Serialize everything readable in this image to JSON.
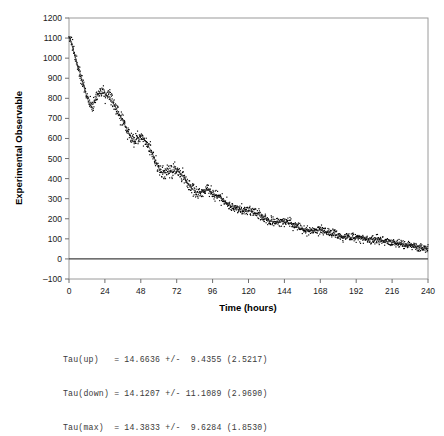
{
  "chart_data": {
    "type": "scatter",
    "title": "",
    "xlabel": "Time (hours)",
    "ylabel": "Experimental Observable",
    "xlim": [
      0,
      240
    ],
    "ylim": [
      -100,
      1200
    ],
    "xticks": [
      0,
      24,
      48,
      72,
      96,
      120,
      144,
      168,
      192,
      216,
      240
    ],
    "yticks": [
      -100,
      0,
      100,
      200,
      300,
      400,
      500,
      600,
      700,
      800,
      900,
      1000,
      1100,
      1200
    ],
    "xtick_labels": [
      "0",
      "24",
      "48",
      "72",
      "96",
      "120",
      "144",
      "168",
      "192",
      "216",
      "240"
    ],
    "ytick_labels": [
      "-100",
      "0",
      "100",
      "200",
      "300",
      "400",
      "500",
      "600",
      "700",
      "800",
      "900",
      "1000",
      "1100",
      "1200"
    ],
    "grid": false,
    "legend": null,
    "zero_line": 0,
    "marker_color": "#000000",
    "fit_line_color": "#333333",
    "series": [
      {
        "name": "Experimental data",
        "type": "scatter",
        "marker": "small-dot",
        "noise_amplitude": 28,
        "n_points": 1400
      },
      {
        "name": "Fitted decay curve",
        "type": "line",
        "model": "damped-oscillatory-exponential"
      }
    ],
    "envelope_x": [
      0,
      4,
      8,
      12,
      14,
      16,
      18,
      20,
      22,
      24,
      28,
      32,
      36,
      40,
      42,
      44,
      46,
      48,
      52,
      56,
      60,
      62,
      64,
      66,
      68,
      70,
      72,
      76,
      80,
      84,
      88,
      90,
      92,
      94,
      96,
      100,
      104,
      108,
      112,
      116,
      120,
      124,
      128,
      132,
      136,
      140,
      144,
      148,
      152,
      156,
      160,
      164,
      168,
      172,
      176,
      180,
      184,
      188,
      192,
      196,
      200,
      204,
      208,
      212,
      216,
      220,
      224,
      228,
      232,
      236,
      240
    ],
    "envelope_y": [
      1105,
      1010,
      910,
      810,
      775,
      772,
      800,
      828,
      832,
      820,
      792,
      742,
      688,
      628,
      600,
      592,
      600,
      612,
      575,
      520,
      452,
      432,
      428,
      432,
      440,
      444,
      442,
      410,
      372,
      338,
      330,
      336,
      344,
      340,
      330,
      310,
      286,
      266,
      250,
      244,
      240,
      232,
      214,
      196,
      186,
      184,
      186,
      178,
      162,
      150,
      142,
      140,
      142,
      136,
      126,
      118,
      112,
      108,
      106,
      104,
      100,
      96,
      92,
      88,
      84,
      80,
      74,
      68,
      62,
      56,
      52
    ]
  },
  "caption": {
    "lines": [
      "Tau(up)   = 14.6636 +/-  9.4355 (2.5217)",
      "Tau(down) = 14.1207 +/- 11.1089 (2.9690)",
      "Tau(max)  = 14.3833 +/-  9.6284 (1.8530)"
    ],
    "line1": "Tau(up)   = 14.6636 +/-  9.4355 (2.5217)",
    "line2": "Tau(down) = 14.1207 +/- 11.1089 (2.9690)",
    "line3": "Tau(max)  = 14.3833 +/-  9.6284 (1.8530)",
    "parameters": [
      {
        "name": "Tau(up)",
        "value": "14.6636",
        "uncertainty": "9.4355",
        "secondary": "2.5217"
      },
      {
        "name": "Tau(down)",
        "value": "14.1207",
        "uncertainty": "11.1089",
        "secondary": "2.9690"
      },
      {
        "name": "Tau(max)",
        "value": "14.3833",
        "uncertainty": "9.6284",
        "secondary": "1.8530"
      }
    ]
  },
  "colors": {
    "background": "#ffffff",
    "axis": "#808080",
    "frame": "#999999",
    "data": "#000000",
    "zero_line": "#404040",
    "text": "#000000",
    "caption_text": "#3a3a3a"
  }
}
